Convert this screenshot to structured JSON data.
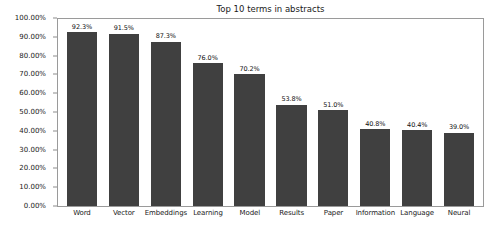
{
  "chart_data": {
    "type": "bar",
    "title": "Top 10 terms in abstracts",
    "xlabel": "",
    "ylabel": "",
    "ylim": [
      0,
      100
    ],
    "grid": false,
    "legend": null,
    "categories": [
      "Word",
      "Vector",
      "Embeddings",
      "Learning",
      "Model",
      "Results",
      "Paper",
      "Information",
      "Language",
      "Neural"
    ],
    "values": [
      92.3,
      91.5,
      87.3,
      76.0,
      70.2,
      53.8,
      51.0,
      40.8,
      40.4,
      39.0
    ],
    "value_labels": [
      "92.3%",
      "91.5%",
      "87.3%",
      "76.0%",
      "70.2%",
      "53.8%",
      "51.0%",
      "40.8%",
      "40.4%",
      "39.0%"
    ],
    "y_ticks": [
      100,
      90,
      80,
      70,
      60,
      50,
      40,
      30,
      20,
      10,
      0
    ],
    "y_tick_labels": [
      "100.00%",
      "90.00%",
      "80.00%",
      "70.00%",
      "60.00%",
      "50.00%",
      "40.00%",
      "30.00%",
      "20.00%",
      "10.00%",
      "0.00%"
    ],
    "bar_color": "#404040",
    "plot_border_color": "#9a9a9a",
    "background_color": "#ffffff",
    "text_color": "#1a1a1a"
  }
}
